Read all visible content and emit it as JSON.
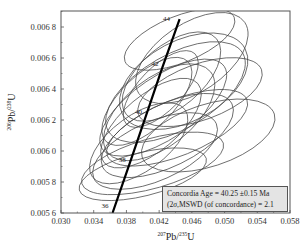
{
  "chart_data": {
    "type": "scatter",
    "subtype": "U-Pb concordia diagram with error ellipses",
    "title": "",
    "xlabel": "207Pb/235U",
    "ylabel": "206Pb/238U",
    "xlabel_parts": {
      "sup": "207",
      "base": "Pb/",
      "sup2": "235",
      "base2": "U"
    },
    "ylabel_parts": {
      "sup": "206",
      "base": "Pb/",
      "sup2": "238",
      "base2": "U"
    },
    "xlim": [
      0.03,
      0.06
    ],
    "ylim": [
      0.0056,
      0.0069
    ],
    "x_ticks": [
      "0.030",
      "0.034",
      "0.038",
      "0.042",
      "0.046",
      "0.050",
      "0.054",
      "0.058"
    ],
    "x_tick_values": [
      0.03,
      0.034,
      0.038,
      0.042,
      0.046,
      0.05,
      0.054,
      0.058
    ],
    "y_ticks": [
      "0.005 6",
      "0.005 8",
      "0.006 0",
      "0.006 2",
      "0.006 4",
      "0.006 6",
      "0.006 8"
    ],
    "y_tick_values": [
      0.0056,
      0.0058,
      0.006,
      0.0062,
      0.0064,
      0.0066,
      0.0068
    ],
    "grid": false,
    "concordia_curve": {
      "age_labels_ma": [
        "36",
        "38",
        "40",
        "42",
        "44"
      ],
      "points": [
        {
          "age": 36,
          "x": 0.0363,
          "y": 0.0056
        },
        {
          "age": 38,
          "x": 0.0384,
          "y": 0.00592
        },
        {
          "age": 40,
          "x": 0.0404,
          "y": 0.00623
        },
        {
          "age": 42,
          "x": 0.0424,
          "y": 0.00654
        },
        {
          "age": 44,
          "x": 0.0445,
          "y": 0.00685
        }
      ]
    },
    "ellipses": [
      {
        "cx": 0.042,
        "cy": 0.00625,
        "rx": 0.008,
        "ry": 0.00022,
        "angle": -38
      },
      {
        "cx": 0.0425,
        "cy": 0.00628,
        "rx": 0.009,
        "ry": 0.0002,
        "angle": -34
      },
      {
        "cx": 0.044,
        "cy": 0.00638,
        "rx": 0.0095,
        "ry": 0.00024,
        "angle": -30
      },
      {
        "cx": 0.041,
        "cy": 0.00618,
        "rx": 0.0075,
        "ry": 0.00018,
        "angle": -40
      },
      {
        "cx": 0.045,
        "cy": 0.00645,
        "rx": 0.0085,
        "ry": 0.00026,
        "angle": -28
      },
      {
        "cx": 0.043,
        "cy": 0.0061,
        "rx": 0.0088,
        "ry": 0.0002,
        "angle": -26
      },
      {
        "cx": 0.0415,
        "cy": 0.006,
        "rx": 0.0082,
        "ry": 0.00019,
        "angle": -24
      },
      {
        "cx": 0.046,
        "cy": 0.0066,
        "rx": 0.0078,
        "ry": 0.00022,
        "angle": -34
      },
      {
        "cx": 0.0405,
        "cy": 0.00632,
        "rx": 0.007,
        "ry": 0.00017,
        "angle": -44
      },
      {
        "cx": 0.0435,
        "cy": 0.00648,
        "rx": 0.0072,
        "ry": 0.0002,
        "angle": -40
      },
      {
        "cx": 0.0442,
        "cy": 0.00615,
        "rx": 0.0092,
        "ry": 0.00018,
        "angle": -22
      },
      {
        "cx": 0.0395,
        "cy": 0.00605,
        "rx": 0.007,
        "ry": 0.00018,
        "angle": -36
      },
      {
        "cx": 0.047,
        "cy": 0.00638,
        "rx": 0.008,
        "ry": 0.00018,
        "angle": -20
      },
      {
        "cx": 0.0445,
        "cy": 0.00672,
        "rx": 0.0072,
        "ry": 0.00015,
        "angle": -22
      },
      {
        "cx": 0.0422,
        "cy": 0.0064,
        "rx": 0.006,
        "ry": 0.00014,
        "angle": -46
      },
      {
        "cx": 0.0412,
        "cy": 0.00592,
        "rx": 0.009,
        "ry": 0.00016,
        "angle": -16
      },
      {
        "cx": 0.048,
        "cy": 0.0061,
        "rx": 0.0085,
        "ry": 0.0002,
        "angle": -18
      },
      {
        "cx": 0.04,
        "cy": 0.00585,
        "rx": 0.008,
        "ry": 0.00014,
        "angle": -14
      }
    ],
    "annotation": {
      "line1": "Concordia Age = 40.25 ±0.15 Ma",
      "line2_prefix": "(2",
      "line2_sigma": "σ",
      "line2_suffix": ",MSWD (of concordance) = 2.1",
      "concordia_age_ma": 40.25,
      "uncertainty_ma": 0.15,
      "mswd": 2.1,
      "position": "lower-right"
    },
    "legend": []
  }
}
